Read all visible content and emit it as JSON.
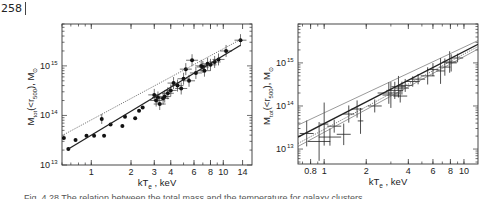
{
  "page": {
    "number": "258"
  },
  "caption": {
    "text": "Fig. 4.28 The relation between the total mass and the temperature for galaxy clusters"
  },
  "chart_data": [
    {
      "type": "scatter",
      "id": "left",
      "title": "",
      "xlabel": "kT_e , keV",
      "ylabel": "M_tot(<r_500), M_sun",
      "xscale": "log",
      "yscale": "log",
      "xlim": [
        0.6,
        16.5
      ],
      "ylim": [
        10000000000000.0,
        7000000000000000.0
      ],
      "x_ticks": [
        {
          "label": "1",
          "value": 1
        },
        {
          "label": "2",
          "value": 2
        },
        {
          "label": "3",
          "value": 3
        },
        {
          "label": "4",
          "value": 4
        },
        {
          "label": "6",
          "value": 6
        },
        {
          "label": "8",
          "value": 8
        },
        {
          "label": "10",
          "value": 10
        },
        {
          "label": "14",
          "value": 14
        }
      ],
      "y_ticks": [
        {
          "label": "10",
          "exp": "13",
          "value": 10000000000000.0
        },
        {
          "label": "10",
          "exp": "14",
          "value": 100000000000000.0
        },
        {
          "label": "10",
          "exp": "15",
          "value": 1000000000000000.0
        }
      ],
      "grid": false,
      "legend": null,
      "series": [
        {
          "name": "clusters (dots)",
          "marker": "filled-circle",
          "points": [
            [
              0.62,
              35000000000000.0
            ],
            [
              0.67,
              21000000000000.0
            ],
            [
              0.76,
              32000000000000.0
            ],
            [
              0.92,
              39000000000000.0
            ],
            [
              1.05,
              39000000000000.0
            ],
            [
              1.2,
              85000000000000.0
            ],
            [
              1.25,
              39000000000000.0
            ],
            [
              1.4,
              66000000000000.0
            ],
            [
              1.72,
              61000000000000.0
            ],
            [
              1.8,
              94000000000000.0
            ],
            [
              2.15,
              88000000000000.0
            ],
            [
              2.3,
              125000000000000.0
            ],
            [
              2.45,
              145000000000000.0
            ],
            [
              3.0,
              260000000000000.0
            ],
            [
              3.1,
              200000000000000.0
            ],
            [
              3.2,
              230000000000000.0
            ],
            [
              3.3,
              170000000000000.0
            ],
            [
              3.5,
              220000000000000.0
            ],
            [
              3.6,
              240000000000000.0
            ],
            [
              3.8,
              280000000000000.0
            ],
            [
              4.0,
              320000000000000.0
            ],
            [
              4.2,
              450000000000000.0
            ],
            [
              4.5,
              400000000000000.0
            ],
            [
              4.8,
              350000000000000.0
            ],
            [
              5.0,
              550000000000000.0
            ],
            [
              5.2,
              860000000000000.0
            ],
            [
              5.5,
              500000000000000.0
            ],
            [
              5.8,
              1300000000000000.0
            ],
            [
              6.2,
              720000000000000.0
            ],
            [
              6.8,
              1000000000000000.0
            ],
            [
              7.0,
              950000000000000.0
            ],
            [
              7.2,
              800000000000000.0
            ],
            [
              7.6,
              1100000000000000.0
            ],
            [
              8.0,
              1050000000000000.0
            ],
            [
              8.6,
              1200000000000000.0
            ],
            [
              9.2,
              1350000000000000.0
            ],
            [
              10.5,
              2000000000000000.0
            ],
            [
              13.5,
              3300000000000000.0
            ]
          ]
        },
        {
          "name": "fit (solid)",
          "style": "solid",
          "points": [
            [
              0.67,
              21000000000000.0
            ],
            [
              13.5,
              2600000000000000.0
            ]
          ]
        },
        {
          "name": "fit (dotted)",
          "style": "dotted",
          "points": [
            [
              0.62,
              41000000000000.0
            ],
            [
              13.5,
              3400000000000000.0
            ]
          ]
        }
      ]
    },
    {
      "type": "scatter",
      "id": "right",
      "title": "",
      "xlabel": "kT_e , keV",
      "ylabel": "M_tot(<r_500), M_sun",
      "xscale": "log",
      "yscale": "log",
      "xlim": [
        0.65,
        12.6
      ],
      "ylim": [
        4500000000000.0,
        8000000000000000.0
      ],
      "x_ticks": [
        {
          "label": "0.8",
          "value": 0.8
        },
        {
          "label": "1",
          "value": 1
        },
        {
          "label": "2",
          "value": 2
        },
        {
          "label": "4",
          "value": 4
        },
        {
          "label": "6",
          "value": 6
        },
        {
          "label": "8",
          "value": 8
        },
        {
          "label": "10",
          "value": 10
        }
      ],
      "y_ticks": [
        {
          "label": "10",
          "exp": "13",
          "value": 10000000000000.0
        },
        {
          "label": "10",
          "exp": "14",
          "value": 100000000000000.0
        },
        {
          "label": "10",
          "exp": "15",
          "value": 1000000000000000.0
        }
      ],
      "grid": false,
      "legend": null,
      "series": [
        {
          "name": "clusters (error crosses)",
          "marker": "cross",
          "points": [
            [
              0.75,
              23000000000000.0,
              0.05,
              0.3
            ],
            [
              0.92,
              15000000000000.0,
              0.08,
              0.45
            ],
            [
              1.0,
              38000000000000.0,
              0.03,
              0.5
            ],
            [
              1.1,
              19000000000000.0,
              0.08,
              0.2
            ],
            [
              1.18,
              34000000000000.0,
              0.05,
              0.15
            ],
            [
              1.38,
              22000000000000.0,
              0.05,
              0.25
            ],
            [
              1.5,
              65000000000000.0,
              0.04,
              0.2
            ],
            [
              1.72,
              85000000000000.0,
              0.04,
              0.2
            ],
            [
              1.82,
              45000000000000.0,
              0.02,
              0.3
            ],
            [
              2.3,
              100000000000000.0,
              0.05,
              0.15
            ],
            [
              2.9,
              200000000000000.0,
              0.08,
              0.25
            ],
            [
              3.0,
              180000000000000.0,
              0.06,
              0.3
            ],
            [
              3.2,
              230000000000000.0,
              0.06,
              0.2
            ],
            [
              3.4,
              280000000000000.0,
              0.05,
              0.25
            ],
            [
              3.5,
              170000000000000.0,
              0.05,
              0.15
            ],
            [
              3.6,
              260000000000000.0,
              0.05,
              0.15
            ],
            [
              3.8,
              300000000000000.0,
              0.05,
              0.15
            ],
            [
              4.3,
              370000000000000.0,
              0.05,
              0.12
            ],
            [
              4.7,
              420000000000000.0,
              0.05,
              0.12
            ],
            [
              5.5,
              500000000000000.0,
              0.05,
              0.2
            ],
            [
              6.0,
              700000000000000.0,
              0.04,
              0.15
            ],
            [
              6.8,
              650000000000000.0,
              0.03,
              0.3
            ],
            [
              7.3,
              800000000000000.0,
              0.04,
              0.2
            ],
            [
              7.9,
              1050000000000000.0,
              0.05,
              0.25
            ],
            [
              8.1,
              1000000000000000.0,
              0.04,
              0.2
            ],
            [
              9.0,
              1300000000000000.0,
              0.04,
              0.1
            ]
          ]
        },
        {
          "name": "fit (upper thin)",
          "style": "solid-thin",
          "points": [
            [
              0.65,
              36000000000000.0
            ],
            [
              12.6,
              3300000000000000.0
            ]
          ]
        },
        {
          "name": "fit (solid thick)",
          "style": "solid",
          "points": [
            [
              0.65,
              19000000000000.0
            ],
            [
              12.6,
              2700000000000000.0
            ]
          ]
        },
        {
          "name": "fit (dotted)",
          "style": "dotted",
          "points": [
            [
              0.65,
              13500000000000.0
            ],
            [
              12.6,
              2400000000000000.0
            ]
          ]
        },
        {
          "name": "fit (lower thin)",
          "style": "solid-thin",
          "points": [
            [
              0.65,
              11500000000000.0
            ],
            [
              12.6,
              2100000000000000.0
            ]
          ]
        }
      ]
    }
  ]
}
